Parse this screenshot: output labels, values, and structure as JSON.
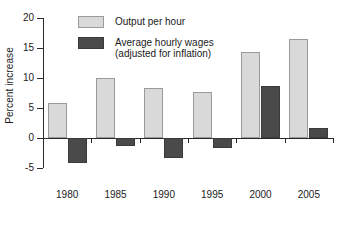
{
  "chart_data": {
    "type": "bar",
    "title": "",
    "subtitle": "",
    "xlabel": "",
    "ylabel": "Percent increase",
    "categories": [
      "1980",
      "1985",
      "1990",
      "1995",
      "2000",
      "2005"
    ],
    "series": [
      {
        "name": "Output per hour",
        "color": "#d9d9d9",
        "values": [
          5.8,
          10.0,
          8.4,
          7.6,
          14.3,
          16.5
        ]
      },
      {
        "name": "Average hourly wages (adjusted for inflation)",
        "color": "#4a4a4a",
        "values": [
          -4.2,
          -1.3,
          -3.3,
          -1.7,
          8.6,
          1.7
        ]
      }
    ],
    "ylim": [
      -5,
      20
    ],
    "yticks": [
      -5,
      0,
      5,
      10,
      15,
      20
    ],
    "ytick_labels": [
      "-5",
      "0",
      "5",
      "10",
      "15",
      "20"
    ],
    "grid": false,
    "legend_position": "top-left"
  },
  "legend": {
    "entries": [
      {
        "label": "Output per hour",
        "sublabel": ""
      },
      {
        "label": "Average hourly wages",
        "sublabel": "(adjusted for inflation)"
      }
    ]
  },
  "axis": {
    "y_title": "Percent increase"
  }
}
